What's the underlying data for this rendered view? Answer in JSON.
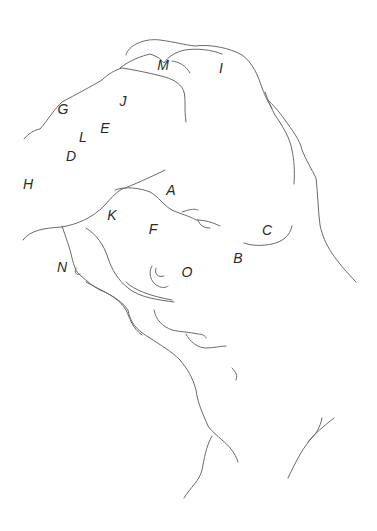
{
  "diagram": {
    "type": "line-sketch",
    "stroke_color": "#6a6a6a",
    "label_color": "#2a2a2a",
    "background": "#ffffff",
    "labels": [
      {
        "text": "M",
        "x": 163,
        "y": 65
      },
      {
        "text": "I",
        "x": 221,
        "y": 68
      },
      {
        "text": "J",
        "x": 123,
        "y": 101
      },
      {
        "text": "G",
        "x": 63,
        "y": 109
      },
      {
        "text": "E",
        "x": 105,
        "y": 128
      },
      {
        "text": "L",
        "x": 83,
        "y": 137
      },
      {
        "text": "D",
        "x": 71,
        "y": 156
      },
      {
        "text": "H",
        "x": 28,
        "y": 184
      },
      {
        "text": "A",
        "x": 171,
        "y": 190
      },
      {
        "text": "K",
        "x": 112,
        "y": 215
      },
      {
        "text": "F",
        "x": 153,
        "y": 229
      },
      {
        "text": "C",
        "x": 267,
        "y": 230
      },
      {
        "text": "B",
        "x": 238,
        "y": 258
      },
      {
        "text": "N",
        "x": 62,
        "y": 267
      },
      {
        "text": "O",
        "x": 187,
        "y": 272
      }
    ]
  }
}
